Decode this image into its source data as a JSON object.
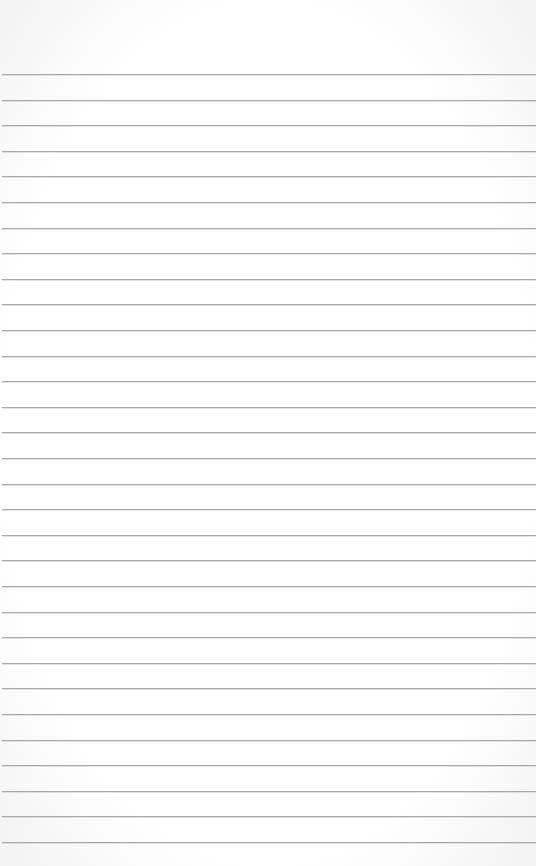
{
  "page": {
    "type": "lined-paper",
    "background": "#ffffff",
    "rule_color": "#a9a9a9",
    "first_rule_y": 74,
    "rule_spacing": 25.6,
    "rule_count": 31
  }
}
